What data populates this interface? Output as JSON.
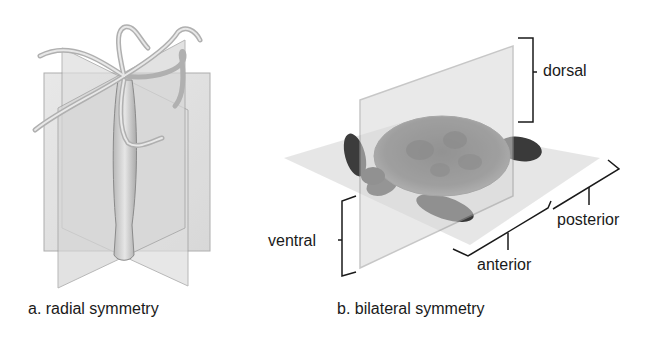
{
  "panels": [
    {
      "id": "a",
      "caption": "a. radial symmetry",
      "subject": "hydra",
      "description": "Hydra with tentacles intersected by multiple vertical planes of symmetry"
    },
    {
      "id": "b",
      "caption": "b. bilateral symmetry",
      "subject": "sea turtle",
      "description": "Sea turtle intersected by a vertical sagittal plane and a horizontal plane",
      "labels": {
        "dorsal": "dorsal",
        "ventral": "ventral",
        "anterior": "anterior",
        "posterior": "posterior"
      }
    }
  ],
  "colors": {
    "plane_fill": "#d9d9d9",
    "plane_edge": "#9a9a9a",
    "text": "#1a1a1a",
    "turtle_shell": "#4a4a4a",
    "turtle_skin": "#3a3a3a"
  }
}
